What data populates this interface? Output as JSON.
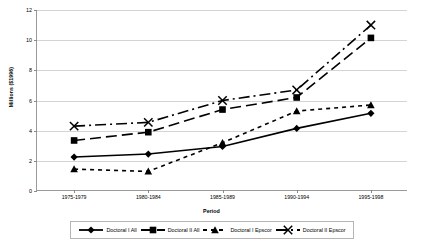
{
  "chart_data": {
    "type": "line",
    "title": "",
    "xlabel": "Period",
    "ylabel": "Millions ($1996)",
    "categories": [
      "1975-1979",
      "1980-1984",
      "1985-1989",
      "1990-1994",
      "1995-1998"
    ],
    "ylim": [
      0,
      12
    ],
    "ytick_values": [
      0,
      2,
      4,
      6,
      8,
      10,
      12
    ],
    "ytick_labels": [
      "0",
      "2",
      "4",
      "6",
      "8",
      "10",
      "12"
    ],
    "grid": true,
    "legend_position": "bottom",
    "series": [
      {
        "name": "Doctoral I All",
        "marker": "diamond",
        "line_style": "solid",
        "color": "#000000",
        "values": [
          2.25,
          2.45,
          2.95,
          4.15,
          5.15
        ]
      },
      {
        "name": "Doctoral II All",
        "marker": "square",
        "line_style": "long-dash",
        "color": "#000000",
        "values": [
          3.35,
          3.9,
          5.4,
          6.2,
          10.15
        ]
      },
      {
        "name": "Doctoral I Epscor",
        "marker": "triangle",
        "line_style": "short-dash",
        "color": "#000000",
        "values": [
          1.45,
          1.3,
          3.2,
          5.3,
          5.7
        ]
      },
      {
        "name": "Doctoral II Epscor",
        "marker": "cross",
        "line_style": "dash-dot",
        "color": "#000000",
        "values": [
          4.3,
          4.55,
          6.0,
          6.7,
          11.0
        ]
      }
    ]
  },
  "legend": {
    "entries": [
      {
        "label": "Doctoral I All"
      },
      {
        "label": "Doctoral II All"
      },
      {
        "label": "Doctoral I Epscor"
      },
      {
        "label": "Doctoral II Epscor"
      }
    ]
  },
  "colors": {
    "axis": "#9a9a9a",
    "grid": "#d4d4d4",
    "series": "#000000",
    "background": "#ffffff"
  }
}
